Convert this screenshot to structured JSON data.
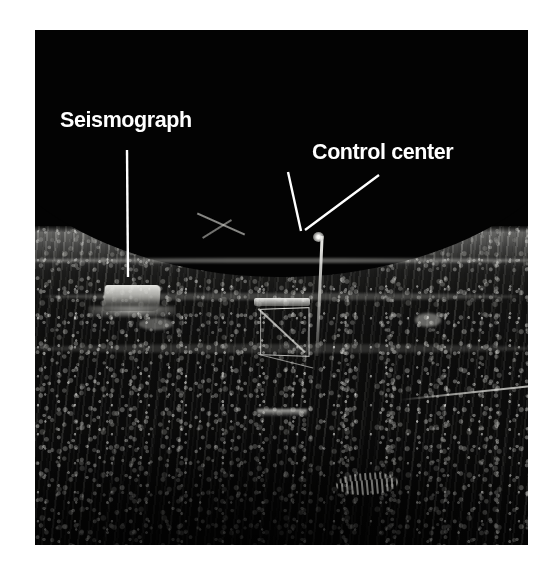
{
  "page": {
    "background_color": "#ffffff",
    "type": "annotated-photograph"
  },
  "photo": {
    "subject": "lunar-surface-alsep-deployment",
    "palette": {
      "sky": "#030303",
      "regolith_highlight": "#e6e6e2",
      "regolith_midtone": "#777774",
      "shadow": "#000000",
      "annotation": "#ffffff"
    },
    "frame": {
      "left": 35,
      "top": 30,
      "width": 493,
      "height": 515
    }
  },
  "annotations": {
    "callouts": [
      {
        "id": "seismograph",
        "label": "Seismograph",
        "label_x": 60,
        "label_y": 110,
        "leader_lines": [
          {
            "x1": 127,
            "y1": 150,
            "x2": 128,
            "y2": 277
          }
        ]
      },
      {
        "id": "control-center",
        "label": "Control center",
        "label_x": 312,
        "label_y": 142,
        "leader_lines": [
          {
            "x1": 288,
            "y1": 172,
            "x2": 301,
            "y2": 231
          },
          {
            "x1": 379,
            "y1": 175,
            "x2": 305,
            "y2": 230
          }
        ]
      }
    ]
  }
}
